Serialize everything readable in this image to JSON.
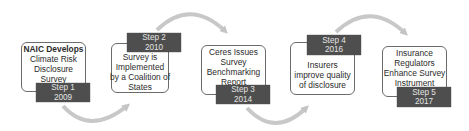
{
  "diagram": {
    "type": "process-flow",
    "steps": [
      {
        "step": "Step 1",
        "year": "2009",
        "lines": [
          "NAIC Develops",
          "Climate Risk",
          "Disclosure",
          "Survey"
        ]
      },
      {
        "step": "Step 2",
        "year": "2010",
        "lines": [
          "Survey is",
          "Implemented",
          "by a Coalition of",
          "States"
        ]
      },
      {
        "step": "Step 3",
        "year": "2014",
        "lines": [
          "Ceres Issues",
          "Survey",
          "Benchmarking",
          "Report"
        ]
      },
      {
        "step": "Step 4",
        "year": "2016",
        "lines": [
          "Insurers",
          "improve quality",
          "of disclosure"
        ]
      },
      {
        "step": "Step 5",
        "year": "2017",
        "lines": [
          "Insurance",
          "Regulators",
          "Enhance Survey",
          "Instrument"
        ]
      }
    ],
    "colors": {
      "tag_bg": "#4e4e4e",
      "tag_text": "#e4e4e4",
      "arrow": "#c4c4c4",
      "box_border": "#6b6b6b",
      "text": "#2b2b2b"
    }
  }
}
